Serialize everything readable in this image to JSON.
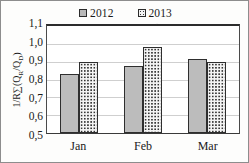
{
  "chart_data": {
    "type": "bar",
    "title": "",
    "xlabel": "",
    "ylabel": "1/R∑(Qʀ/Qᴅ)",
    "ylabel_parts": {
      "prefix": "1/R∑(Q",
      "sub1": "R",
      "mid": "/Q",
      "sub2": "D",
      "suffix": ")"
    },
    "categories": [
      "Jan",
      "Feb",
      "Mar"
    ],
    "series": [
      {
        "name": "2012",
        "values": [
          0.83,
          0.875,
          0.915
        ],
        "fill": "solid",
        "color": "#bcbcbc"
      },
      {
        "name": "2013",
        "values": [
          0.9,
          0.98,
          0.9
        ],
        "fill": "dots",
        "color": "#f4f4f4"
      }
    ],
    "ylim": [
      0.5,
      1.1
    ],
    "ytick_labels": [
      "1,1",
      "1,0",
      "0,9",
      "0,8",
      "0,7",
      "0,6",
      "0,5"
    ],
    "ytick_values": [
      1.1,
      1.0,
      0.9,
      0.8,
      0.7,
      0.6,
      0.5
    ],
    "grid": true,
    "legend_position": "top-center",
    "decimal_separator": ","
  },
  "legend": {
    "items": [
      {
        "label": "2012",
        "swatch": "solid-gray-swatch-icon"
      },
      {
        "label": "2013",
        "swatch": "dotted-pattern-swatch-icon"
      }
    ]
  }
}
